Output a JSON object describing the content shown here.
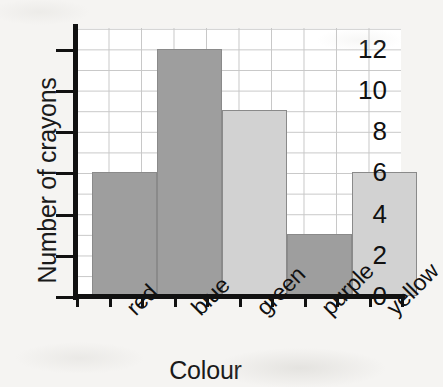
{
  "chart_data": {
    "type": "bar",
    "title": "",
    "xlabel": "Colour",
    "ylabel": "Number of crayons",
    "categories": [
      "red",
      "blue",
      "green",
      "purple",
      "yellow"
    ],
    "values": [
      6,
      12,
      9,
      3,
      6
    ],
    "ylim": [
      0,
      13
    ],
    "ytick_labels": [
      "0",
      "2",
      "4",
      "6",
      "8",
      "10",
      "12"
    ],
    "ytick_values": [
      0,
      2,
      4,
      6,
      8,
      10,
      12
    ],
    "y_major_step": 2,
    "y_minor_step": 1,
    "grid": true,
    "legend": false,
    "bar_colors": [
      "#9e9e9e",
      "#9e9e9e",
      "#d2d2d2",
      "#9e9e9e",
      "#d2d2d2"
    ],
    "bar_edge_color": "#8a8a8a",
    "axis_color": "#111111",
    "grid_color": "#c8c8c8",
    "plot_background": "#ffffff",
    "figure_background": "#f5f4f2",
    "xtick_label_rotation": -45
  }
}
